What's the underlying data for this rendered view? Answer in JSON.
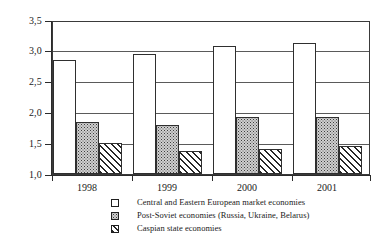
{
  "chart_data": {
    "type": "bar",
    "title": "",
    "subtitle": "",
    "xlabel": "",
    "ylabel": "",
    "categories": [
      "1998",
      "1999",
      "2000",
      "2001"
    ],
    "ylim": [
      1.0,
      3.5
    ],
    "ytick_labels": [
      "3,5",
      "3,0",
      "2,5",
      "2,0",
      "1,5",
      "1,0"
    ],
    "ytick_values": [
      3.5,
      3.0,
      2.5,
      2.0,
      1.5,
      1.0
    ],
    "grid": true,
    "legend_position": "bottom",
    "decimal_separator": ",",
    "series": [
      {
        "name": "Central and Eastern European market economies",
        "pattern": "light-dots",
        "values": [
          2.85,
          2.95,
          3.08,
          3.13
        ]
      },
      {
        "name": "Post-Soviet  economies (Russia, Ukraine, Belarus)",
        "pattern": "dense-dots",
        "values": [
          1.84,
          1.8,
          1.93,
          1.92
        ]
      },
      {
        "name": "Caspian  state economies",
        "pattern": "diagonal-hatch",
        "values": [
          1.5,
          1.38,
          1.41,
          1.45
        ]
      }
    ]
  },
  "axis": {
    "y_labels": [
      "3,5",
      "3,0",
      "2,5",
      "2,0",
      "1,5",
      "1,0"
    ],
    "x_labels": [
      "1998",
      "1999",
      "2000",
      "2001"
    ]
  },
  "legend": {
    "items": [
      {
        "label": "Central and Eastern European market economies",
        "swatch": "empty-square-icon"
      },
      {
        "label": "Post-Soviet  economies (Russia, Ukraine, Belarus)",
        "swatch": "dotted-square-icon"
      },
      {
        "label": "Caspian  state economies",
        "swatch": "hatched-square-icon"
      }
    ]
  },
  "colors": {
    "frame": "#3a3a3a",
    "grid": "#5a5a5a",
    "bar_outline": "#2f2f2f",
    "text": "#1a1a1a",
    "background": "#ffffff"
  }
}
